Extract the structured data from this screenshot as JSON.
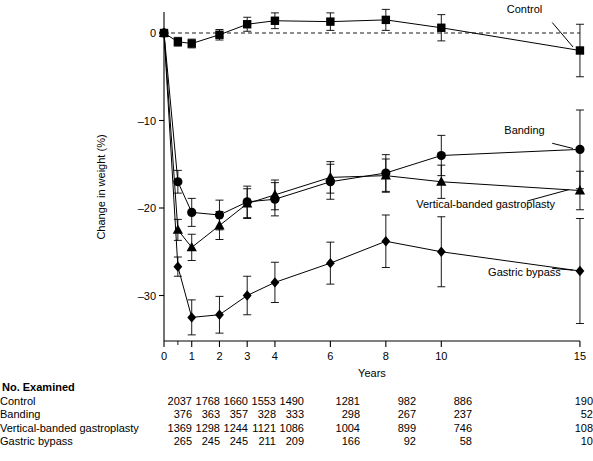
{
  "chart_data": {
    "type": "line",
    "title": "",
    "xlabel": "Years",
    "ylabel": "Change in weight (%)",
    "xticks": [
      0,
      1,
      2,
      3,
      4,
      6,
      8,
      10,
      15
    ],
    "xticklabels": [
      "0",
      "1",
      "2",
      "3",
      "4",
      "6",
      "8",
      "10",
      "15"
    ],
    "yticks": [
      0,
      -10,
      -20,
      -30
    ],
    "yticklabels": [
      "0",
      "–10",
      "–20",
      "–30"
    ],
    "xlim": [
      0,
      15
    ],
    "ylim": [
      -35,
      3
    ],
    "grid": false,
    "legend_position": "inline-annotations",
    "zero_reference_line": true,
    "x": [
      0,
      0.5,
      1,
      2,
      3,
      4,
      6,
      8,
      10,
      15
    ],
    "series": [
      {
        "name": "Control",
        "marker": "square",
        "values": [
          0,
          -1.0,
          -1.2,
          -0.2,
          1.0,
          1.4,
          1.3,
          1.5,
          0.6,
          -2.0
        ],
        "errors": [
          0,
          0.5,
          0.5,
          0.6,
          0.8,
          0.9,
          1.0,
          1.2,
          1.5,
          3.0
        ]
      },
      {
        "name": "Banding",
        "marker": "circle",
        "values": [
          0,
          -17.0,
          -20.5,
          -20.8,
          -19.3,
          -19.0,
          -17.0,
          -16.0,
          -14.0,
          -13.3
        ],
        "errors": [
          0,
          1.3,
          1.6,
          1.7,
          1.8,
          1.9,
          2.0,
          2.1,
          2.3,
          4.5
        ]
      },
      {
        "name": "Vertical-banded gastroplasty",
        "marker": "triangle",
        "values": [
          0,
          -22.5,
          -24.5,
          -22.0,
          -19.5,
          -18.5,
          -16.5,
          -16.3,
          -17.0,
          -18.0
        ],
        "errors": [
          0,
          1.2,
          1.5,
          1.6,
          1.7,
          1.7,
          1.8,
          1.9,
          1.9,
          2.2
        ]
      },
      {
        "name": "Gastric bypass",
        "marker": "diamond",
        "values": [
          0,
          -26.7,
          -32.5,
          -32.2,
          -30.0,
          -28.5,
          -26.3,
          -23.8,
          -25.0,
          -27.2
        ],
        "errors": [
          0,
          1.1,
          2.0,
          2.1,
          2.2,
          2.3,
          2.4,
          3.0,
          4.0,
          6.0
        ]
      }
    ],
    "annotations": [
      {
        "text": "Control",
        "x": 13.0,
        "y": 2.3
      },
      {
        "text": "Banding",
        "x": 13.0,
        "y": -11.5
      },
      {
        "text": "Vertical-banded gastroplasty",
        "x": 11.6,
        "y": -20.0
      },
      {
        "text": "Gastric bypass",
        "x": 13.0,
        "y": -27.8
      }
    ]
  },
  "counts_table": {
    "heading": "No. Examined",
    "column_years": [
      "0",
      "1",
      "2",
      "3",
      "4",
      "6",
      "8",
      "10",
      "15"
    ],
    "rows": [
      {
        "label": "Control",
        "values": [
          "2037",
          "1768",
          "1660",
          "1553",
          "1490",
          "1281",
          "982",
          "886",
          "190"
        ]
      },
      {
        "label": "Banding",
        "values": [
          "376",
          "363",
          "357",
          "328",
          "333",
          "298",
          "267",
          "237",
          "52"
        ]
      },
      {
        "label": "Vertical-banded gastroplasty",
        "values": [
          "1369",
          "1298",
          "1244",
          "1121",
          "1086",
          "1004",
          "899",
          "746",
          "108"
        ]
      },
      {
        "label": "Gastric bypass",
        "values": [
          "265",
          "245",
          "245",
          "211",
          "209",
          "166",
          "92",
          "58",
          "10"
        ]
      }
    ]
  },
  "colors": {
    "ink": "#000000",
    "background": "#ffffff"
  }
}
